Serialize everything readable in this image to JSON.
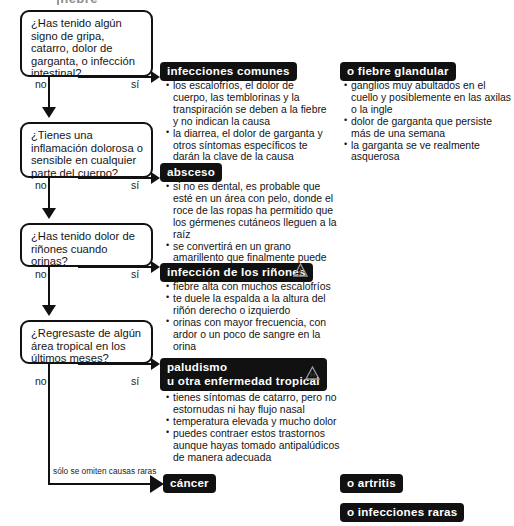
{
  "header": {
    "title": "fiebre"
  },
  "questions": [
    {
      "id": "q1",
      "text": "¿Has tenido algún signo de gripa, catarro, dolor de garganta, o infección intestinal?",
      "no_label": "no",
      "yes_label": "sí"
    },
    {
      "id": "q2",
      "text": "¿Tienes una inflamación dolorosa o sensible en cualquier parte del cuerpo?",
      "no_label": "no",
      "yes_label": "sí"
    },
    {
      "id": "q3",
      "text": "¿Has tenido dolor de riñones cuando orinas?",
      "no_label": "no",
      "yes_label": "sí"
    },
    {
      "id": "q4",
      "text": "¿Regresaste de algún área tropical en los últimos meses?",
      "no_label": "no",
      "yes_label": "sí"
    }
  ],
  "outcomes": [
    {
      "id": "infecciones-comunes",
      "title": "infecciones comunes",
      "icon": null,
      "bullets": [
        "los escalofríos, el dolor de cuerpo, las temblorinas y la transpiración se deben a la fiebre y no indican la causa",
        "la diarrea, el dolor de garganta y otros síntomas específicos te darán la clave de la causa"
      ]
    },
    {
      "id": "absceso",
      "title": "absceso",
      "icon": null,
      "bullets": [
        "si no es dental, es probable que esté en un área con pelo, donde el roce de las ropas ha permitido que los gérmenes cutáneos lleguen a la raíz",
        "se convertirá en un grano amarillento que finalmente puede supurar"
      ]
    },
    {
      "id": "infeccion-rinones",
      "title": "infección de los riñones",
      "icon": "warning-triangle-icon",
      "bullets": [
        "fiebre alta con muchos escalofríos",
        "te duele la espalda a la altura del riñón derecho o izquierdo",
        "orinas con mayor frecuencia, con ardor o un poco de sangre en la orina"
      ]
    },
    {
      "id": "paludismo",
      "title": "paludismo",
      "title_line2": "u otra enfermedad tropical",
      "icon": "hospital-triangle-icon",
      "bullets": [
        "tienes síntomas de catarro, pero no estornudas ni hay flujo nasal",
        "temperatura elevada y mucho dolor",
        "puedes contraer estos trastornos aunque hayas tomado antipalúdicos de manera adecuada"
      ]
    }
  ],
  "side_outcomes": [
    {
      "id": "fiebre-glandular",
      "title": "o fiebre glandular",
      "bullets": [
        "ganglios muy abultados en el cuello y posiblemente en las axilas o la ingle",
        "dolor de garganta que persiste más de una semana",
        "la garganta se ve realmente asquerosa"
      ]
    }
  ],
  "terminal": {
    "footnote": "sólo se omiten causas raras",
    "cancer_label": "cáncer",
    "arthritis_label": "o artritis",
    "rare_infections_label": "o infecciones raras"
  },
  "colors": {
    "ink": "#111111",
    "paper": "#ffffff",
    "banner_bg": "#111111",
    "banner_text": "#ffffff",
    "header_gray": "#8d8d8d"
  }
}
